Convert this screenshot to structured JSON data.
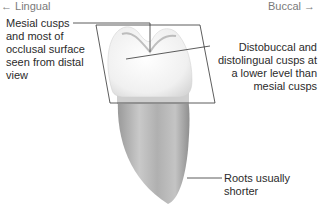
{
  "directions": {
    "left": "← Lingual",
    "right": "Buccal →"
  },
  "labels": {
    "mesial": [
      "Mesial cusps",
      "and most of",
      "occlusal surface",
      "seen from distal",
      "view"
    ],
    "distal": [
      "Distobuccal and",
      "distolingual cusps at",
      "a lower level than",
      "mesial cusps"
    ],
    "roots": "Roots usually shorter"
  },
  "colors": {
    "line": "#333333",
    "tooth_light": "#f4f4f4",
    "root": "#a8a8a8"
  }
}
